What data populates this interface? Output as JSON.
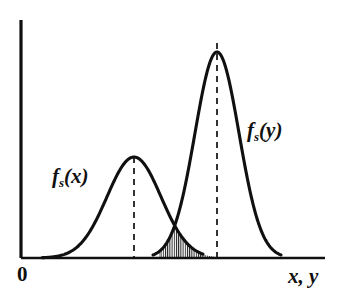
{
  "figure": {
    "background_color": "#ffffff",
    "stroke_color": "#101010",
    "width": 339,
    "height": 296
  },
  "axes": {
    "origin_label": "0",
    "axis_label": "x,  y",
    "y_axis": {
      "x": 21,
      "y_top": 20,
      "y_bottom": 258
    },
    "x_axis": {
      "y": 258,
      "x_left": 21,
      "x_right": 325
    }
  },
  "curves": [
    {
      "id": "curve-fsx",
      "label_base": "f",
      "label_sub": "s",
      "label_arg": "(x)",
      "label_full": "fs(x)",
      "peak_x": 134,
      "peak_y": 157,
      "amplitude": 101,
      "sigma": 27,
      "tail_start_x": 42,
      "tail_end_x": 203,
      "dash_line_x": 134,
      "dash_top_y": 157,
      "label_position": {
        "x": 52,
        "y": 166
      }
    },
    {
      "id": "curve-fsy",
      "label_base": "f",
      "label_sub": "s",
      "label_arg": "(y)",
      "label_full": "fs(y)",
      "peak_x": 217,
      "peak_y": 52,
      "amplitude": 206,
      "sigma": 22,
      "tail_start_x": 153,
      "tail_end_x": 281,
      "dash_line_x": 217,
      "dash_top_y": 43,
      "label_position": {
        "x": 247,
        "y": 120
      }
    }
  ],
  "overlap_region": {
    "id": "hatched-overlap",
    "hatch_style": "vertical-lines",
    "hatch_spacing_px": 2.2,
    "x_start": 159,
    "x_end": 217,
    "intersection_x": 181,
    "intersection_y": 228,
    "baseline_y": 258
  },
  "chart_data": {
    "type": "line",
    "title": "",
    "xlabel": "x,  y",
    "ylabel": "",
    "grid": false,
    "legend": "inline-annotations",
    "annotations": [
      "fs(x)",
      "fs(y)",
      "0",
      "x,  y"
    ],
    "series": [
      {
        "name": "fs(x)",
        "distribution": "gaussian",
        "mean_px": 134,
        "sigma_px": 27,
        "peak_height_px": 101
      },
      {
        "name": "fs(y)",
        "distribution": "gaussian",
        "mean_px": 217,
        "sigma_px": 22,
        "peak_height_px": 206
      }
    ],
    "shaded_overlap": {
      "description": "minimum of the two densities, vertically hatched",
      "x_range_px": [
        159,
        217
      ]
    }
  }
}
